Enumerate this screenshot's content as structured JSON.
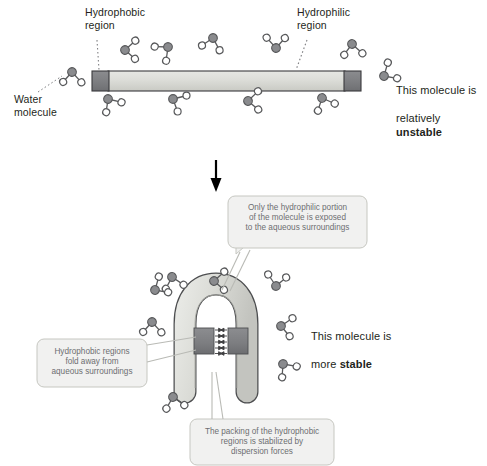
{
  "diagram": {
    "colors": {
      "hydrophobic": "#808184",
      "hydrophilic": "#d6d7d2",
      "outline": "#231f20",
      "water_oxygen": "#808184",
      "water_hydrogen": "#ffffff",
      "callout_fill": "#f1f1f0",
      "callout_stroke": "#c6c7c1",
      "callout_text": "#6d6e71",
      "label_text": "#231f20",
      "arrow": "#000000"
    }
  },
  "top_panel": {
    "labels": {
      "hydrophobic_region": "Hydrophobic\nregion",
      "hydrophilic_region": "Hydrophilic\nregion",
      "water_molecule": "Water\nmolecule"
    },
    "conclusion": {
      "line1": "This molecule is",
      "line2_prefix": "relatively ",
      "line2_emphasis": "unstable"
    },
    "molecule": {
      "shape": "straight-bar",
      "hydrophobic_cap_left": "hydrophobic",
      "hydrophilic_middle": "hydrophilic",
      "hydrophobic_cap_right": "hydrophobic"
    },
    "water_count_above": 6,
    "water_count_below": 4,
    "water_count_sides": 2
  },
  "transition": {
    "icon": "down-arrow-icon",
    "direction": "down"
  },
  "bottom_panel": {
    "callouts": [
      {
        "id": "hydrophilic-exposure",
        "text": "Only the hydrophilic portion\nof the molecule is exposed\nto the aqueous surroundings"
      },
      {
        "id": "hydrophobic-fold",
        "text": "Hydrophobic regions\nfold away from\naqueous surroundings"
      },
      {
        "id": "dispersion-forces",
        "text": "The packing of the hydrophobic\nregions is stabilized by\ndispersion forces"
      }
    ],
    "conclusion": {
      "line1": "This molecule is",
      "line2_prefix": "more ",
      "line2_emphasis": "stable"
    },
    "molecule": {
      "shape": "folded-horseshoe",
      "interaction_arrows": "dispersion-force-arrows",
      "arrow_rows": 5
    },
    "water_count": 10
  }
}
